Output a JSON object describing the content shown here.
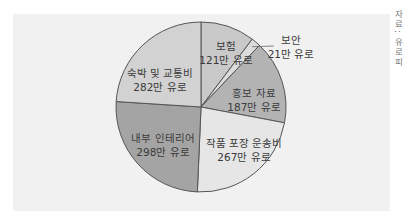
{
  "chart_data": {
    "type": "pie",
    "title": "",
    "unit": "만 유로",
    "categories": [
      "보험",
      "보안",
      "홍보 자료",
      "작품 포장 운송비",
      "내부 인테리어",
      "숙박 및 교통비"
    ],
    "values": [
      121,
      21,
      187,
      267,
      298,
      282
    ],
    "labels": [
      {
        "name": "보험",
        "value": "121만 유로"
      },
      {
        "name": "보안",
        "value": "21만 유로"
      },
      {
        "name": "홍보 자료",
        "value": "187만 유로"
      },
      {
        "name": "작품 포장 운송비",
        "value": "267만 유로"
      },
      {
        "name": "내부 인테리어",
        "value": "298만 유로"
      },
      {
        "name": "숙박 및 교통비",
        "value": "282만 유로"
      }
    ],
    "colors": [
      "#c9c9c9",
      "#dcdcdc",
      "#b3b3b3",
      "#e6e6e6",
      "#a4a4a4",
      "#d2d2d2"
    ],
    "start_angle": "top, clockwise",
    "legend": "none (direct labels)"
  },
  "source_note": "자료: 유로피"
}
